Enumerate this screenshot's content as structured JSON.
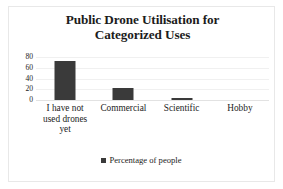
{
  "chart_data": {
    "type": "bar",
    "title": "Public Drone Utilisation for Categorized Uses",
    "title_lines": [
      "Public Drone Utilisation for",
      "Categorized Uses"
    ],
    "categories": [
      "I have not used drones yet",
      "Commercial",
      "Scientific",
      "Hobby"
    ],
    "category_lines": [
      [
        "I have not",
        "used drones",
        "yet"
      ],
      [
        "Commercial"
      ],
      [
        "Scientific"
      ],
      [
        "Hobby"
      ]
    ],
    "values": [
      72,
      22,
      3,
      0
    ],
    "series": [
      {
        "name": "Percentage of people",
        "values": [
          72,
          22,
          3,
          0
        ]
      }
    ],
    "xlabel": "",
    "ylabel": "",
    "ylim": [
      0,
      80
    ],
    "yticks": [
      80,
      60,
      40,
      20,
      0
    ],
    "grid": true,
    "legend": {
      "position": "bottom",
      "entries": [
        {
          "label": "Percentage of people",
          "color": "#3a3a3a"
        }
      ]
    },
    "colors": {
      "bar": "#3a3a3a",
      "gridline": "#f0f0f0",
      "axis": "#e2e2e2",
      "text": "#1c1c1c",
      "background": "#ffffff",
      "border": "#e8e8e8"
    }
  }
}
